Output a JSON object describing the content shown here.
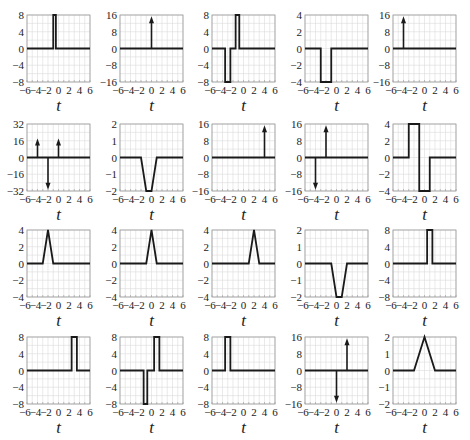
{
  "chart_data": [
    {
      "type": "line",
      "title": "",
      "xlabel": "t",
      "xlim": [
        -6,
        6
      ],
      "ylim": [
        -8,
        8
      ],
      "yticks": [
        -8,
        -4,
        0,
        4,
        8
      ],
      "xticks": [
        -6,
        -4,
        -2,
        0,
        2,
        4,
        6
      ],
      "grid": true,
      "points": [
        [
          -6,
          0
        ],
        [
          -1,
          0
        ],
        [
          -1,
          8
        ],
        [
          -0.5,
          8
        ],
        [
          -0.5,
          0
        ],
        [
          6,
          0
        ]
      ],
      "impulses": []
    },
    {
      "type": "line",
      "title": "",
      "xlabel": "t",
      "xlim": [
        -6,
        6
      ],
      "ylim": [
        -16,
        16
      ],
      "yticks": [
        -16,
        -8,
        0,
        8,
        16
      ],
      "xticks": [
        -6,
        -4,
        -2,
        0,
        2,
        4,
        6
      ],
      "grid": true,
      "points": [
        [
          -6,
          0
        ],
        [
          6,
          0
        ]
      ],
      "impulses": [
        {
          "t": 0,
          "area": 16
        }
      ]
    },
    {
      "type": "line",
      "title": "",
      "xlabel": "t",
      "xlim": [
        -6,
        6
      ],
      "ylim": [
        -8,
        8
      ],
      "yticks": [
        -8,
        -4,
        0,
        4,
        8
      ],
      "xticks": [
        -6,
        -4,
        -2,
        0,
        2,
        4,
        6
      ],
      "grid": true,
      "points": [
        [
          -6,
          0
        ],
        [
          -3.5,
          0
        ],
        [
          -3.5,
          -8
        ],
        [
          -2.5,
          -8
        ],
        [
          -2.5,
          0
        ],
        [
          -1.5,
          0
        ],
        [
          -1.5,
          8
        ],
        [
          -0.8,
          8
        ],
        [
          -0.8,
          0
        ],
        [
          6,
          0
        ]
      ],
      "impulses": []
    },
    {
      "type": "line",
      "title": "",
      "xlabel": "t",
      "xlim": [
        -6,
        6
      ],
      "ylim": [
        -4,
        4
      ],
      "yticks": [
        -4,
        -2,
        0,
        2,
        4
      ],
      "xticks": [
        -6,
        -4,
        -2,
        0,
        2,
        4,
        6
      ],
      "grid": true,
      "points": [
        [
          -6,
          0
        ],
        [
          -3,
          0
        ],
        [
          -3,
          -4
        ],
        [
          -1,
          -4
        ],
        [
          -1,
          0
        ],
        [
          6,
          0
        ]
      ],
      "impulses": []
    },
    {
      "type": "line",
      "title": "",
      "xlabel": "t",
      "xlim": [
        -6,
        6
      ],
      "ylim": [
        -16,
        16
      ],
      "yticks": [
        -16,
        -8,
        0,
        8,
        16
      ],
      "xticks": [
        -6,
        -4,
        -2,
        0,
        2,
        4,
        6
      ],
      "grid": true,
      "points": [
        [
          -6,
          0
        ],
        [
          6,
          0
        ]
      ],
      "impulses": [
        {
          "t": -4,
          "area": 16
        }
      ]
    },
    {
      "type": "line",
      "title": "",
      "xlabel": "t",
      "xlim": [
        -6,
        6
      ],
      "ylim": [
        -32,
        32
      ],
      "yticks": [
        -32,
        -16,
        0,
        16,
        32
      ],
      "xticks": [
        -6,
        -4,
        -2,
        0,
        2,
        4,
        6
      ],
      "grid": true,
      "points": [
        [
          -6,
          0
        ],
        [
          6,
          0
        ]
      ],
      "impulses": [
        {
          "t": -4,
          "area": 16
        },
        {
          "t": -2,
          "area": -32
        },
        {
          "t": 0,
          "area": 16
        }
      ]
    },
    {
      "type": "line",
      "title": "",
      "xlabel": "t",
      "xlim": [
        -6,
        6
      ],
      "ylim": [
        -2,
        2
      ],
      "yticks": [
        -2,
        -1,
        0,
        1,
        2
      ],
      "xticks": [
        -6,
        -4,
        -2,
        0,
        2,
        4,
        6
      ],
      "grid": true,
      "points": [
        [
          -6,
          0
        ],
        [
          -2,
          0
        ],
        [
          -1,
          -2
        ],
        [
          0,
          -2
        ],
        [
          1,
          0
        ],
        [
          6,
          0
        ]
      ],
      "impulses": []
    },
    {
      "type": "line",
      "title": "",
      "xlabel": "t",
      "xlim": [
        -6,
        6
      ],
      "ylim": [
        -16,
        16
      ],
      "yticks": [
        -16,
        -8,
        0,
        8,
        16
      ],
      "xticks": [
        -6,
        -4,
        -2,
        0,
        2,
        4,
        6
      ],
      "grid": true,
      "points": [
        [
          -6,
          0
        ],
        [
          6,
          0
        ]
      ],
      "impulses": [
        {
          "t": 4,
          "area": 16
        }
      ]
    },
    {
      "type": "line",
      "title": "",
      "xlabel": "t",
      "xlim": [
        -6,
        6
      ],
      "ylim": [
        -16,
        16
      ],
      "yticks": [
        -16,
        -8,
        0,
        8,
        16
      ],
      "xticks": [
        -6,
        -4,
        -2,
        0,
        2,
        4,
        6
      ],
      "grid": true,
      "points": [
        [
          -6,
          0
        ],
        [
          6,
          0
        ]
      ],
      "impulses": [
        {
          "t": -4,
          "area": -16
        },
        {
          "t": -2,
          "area": 16
        }
      ]
    },
    {
      "type": "line",
      "title": "",
      "xlabel": "t",
      "xlim": [
        -6,
        6
      ],
      "ylim": [
        -4,
        4
      ],
      "yticks": [
        -4,
        -2,
        0,
        2,
        4
      ],
      "xticks": [
        -6,
        -4,
        -2,
        0,
        2,
        4,
        6
      ],
      "grid": true,
      "points": [
        [
          -6,
          0
        ],
        [
          -3,
          0
        ],
        [
          -3,
          4
        ],
        [
          -1,
          4
        ],
        [
          -1,
          -4
        ],
        [
          1,
          -4
        ],
        [
          1,
          0
        ],
        [
          6,
          0
        ]
      ],
      "impulses": []
    },
    {
      "type": "line",
      "title": "",
      "xlabel": "t",
      "xlim": [
        -6,
        6
      ],
      "ylim": [
        -4,
        4
      ],
      "yticks": [
        -4,
        -2,
        0,
        2,
        4
      ],
      "xticks": [
        -6,
        -4,
        -2,
        0,
        2,
        4,
        6
      ],
      "grid": true,
      "points": [
        [
          -6,
          0
        ],
        [
          -3,
          0
        ],
        [
          -2,
          4
        ],
        [
          -1,
          0
        ],
        [
          6,
          0
        ]
      ],
      "impulses": []
    },
    {
      "type": "line",
      "title": "",
      "xlabel": "t",
      "xlim": [
        -6,
        6
      ],
      "ylim": [
        -4,
        4
      ],
      "yticks": [
        -4,
        -2,
        0,
        2,
        4
      ],
      "xticks": [
        -6,
        -4,
        -2,
        0,
        2,
        4,
        6
      ],
      "grid": true,
      "points": [
        [
          -6,
          0
        ],
        [
          -1,
          0
        ],
        [
          0,
          4
        ],
        [
          1,
          0
        ],
        [
          6,
          0
        ]
      ],
      "impulses": []
    },
    {
      "type": "line",
      "title": "",
      "xlabel": "t",
      "xlim": [
        -6,
        6
      ],
      "ylim": [
        -4,
        4
      ],
      "yticks": [
        -4,
        -2,
        0,
        2,
        4
      ],
      "xticks": [
        -6,
        -4,
        -2,
        0,
        2,
        4,
        6
      ],
      "grid": true,
      "points": [
        [
          -6,
          0
        ],
        [
          1,
          0
        ],
        [
          2,
          4
        ],
        [
          3,
          0
        ],
        [
          6,
          0
        ]
      ],
      "impulses": []
    },
    {
      "type": "line",
      "title": "",
      "xlabel": "t",
      "xlim": [
        -6,
        6
      ],
      "ylim": [
        -2,
        2
      ],
      "yticks": [
        -2,
        -1,
        0,
        1,
        2
      ],
      "xticks": [
        -6,
        -4,
        -2,
        0,
        2,
        4,
        6
      ],
      "grid": true,
      "points": [
        [
          -6,
          0
        ],
        [
          -1,
          0
        ],
        [
          0,
          -2
        ],
        [
          1,
          -2
        ],
        [
          2,
          0
        ],
        [
          6,
          0
        ]
      ],
      "impulses": []
    },
    {
      "type": "line",
      "title": "",
      "xlabel": "t",
      "xlim": [
        -6,
        6
      ],
      "ylim": [
        -8,
        8
      ],
      "yticks": [
        -8,
        -4,
        0,
        4,
        8
      ],
      "xticks": [
        -6,
        -4,
        -2,
        0,
        2,
        4,
        6
      ],
      "grid": true,
      "points": [
        [
          -6,
          0
        ],
        [
          0.5,
          0
        ],
        [
          0.5,
          8
        ],
        [
          1.5,
          8
        ],
        [
          1.5,
          0
        ],
        [
          6,
          0
        ]
      ],
      "impulses": []
    },
    {
      "type": "line",
      "title": "",
      "xlabel": "t",
      "xlim": [
        -6,
        6
      ],
      "ylim": [
        -8,
        8
      ],
      "yticks": [
        -8,
        -4,
        0,
        4,
        8
      ],
      "xticks": [
        -6,
        -4,
        -2,
        0,
        2,
        4,
        6
      ],
      "grid": true,
      "points": [
        [
          -6,
          0
        ],
        [
          2.5,
          0
        ],
        [
          2.5,
          8
        ],
        [
          3.5,
          8
        ],
        [
          3.5,
          0
        ],
        [
          6,
          0
        ]
      ],
      "impulses": []
    },
    {
      "type": "line",
      "title": "",
      "xlabel": "t",
      "xlim": [
        -6,
        6
      ],
      "ylim": [
        -8,
        8
      ],
      "yticks": [
        -8,
        -4,
        0,
        4,
        8
      ],
      "xticks": [
        -6,
        -4,
        -2,
        0,
        2,
        4,
        6
      ],
      "grid": true,
      "points": [
        [
          -6,
          0
        ],
        [
          -1.5,
          0
        ],
        [
          -1.5,
          -8
        ],
        [
          -0.8,
          -8
        ],
        [
          -0.8,
          0
        ],
        [
          0.5,
          0
        ],
        [
          0.5,
          8
        ],
        [
          1.5,
          8
        ],
        [
          1.5,
          0
        ],
        [
          6,
          0
        ]
      ],
      "impulses": []
    },
    {
      "type": "line",
      "title": "",
      "xlabel": "t",
      "xlim": [
        -6,
        6
      ],
      "ylim": [
        -8,
        8
      ],
      "yticks": [
        -8,
        -4,
        0,
        4,
        8
      ],
      "xticks": [
        -6,
        -4,
        -2,
        0,
        2,
        4,
        6
      ],
      "grid": true,
      "points": [
        [
          -6,
          0
        ],
        [
          -3.5,
          0
        ],
        [
          -3.5,
          8
        ],
        [
          -2.5,
          8
        ],
        [
          -2.5,
          0
        ],
        [
          6,
          0
        ]
      ],
      "impulses": []
    },
    {
      "type": "line",
      "title": "",
      "xlabel": "t",
      "xlim": [
        -6,
        6
      ],
      "ylim": [
        -16,
        16
      ],
      "yticks": [
        -16,
        -8,
        0,
        8,
        16
      ],
      "xticks": [
        -6,
        -4,
        -2,
        0,
        2,
        4,
        6
      ],
      "grid": true,
      "points": [
        [
          -6,
          0
        ],
        [
          6,
          0
        ]
      ],
      "impulses": [
        {
          "t": 0,
          "area": -16
        },
        {
          "t": 2,
          "area": 16
        }
      ]
    },
    {
      "type": "line",
      "title": "",
      "xlabel": "t",
      "xlim": [
        -6,
        6
      ],
      "ylim": [
        -2,
        2
      ],
      "yticks": [
        -2,
        -1,
        0,
        1,
        2
      ],
      "xticks": [
        -6,
        -4,
        -2,
        0,
        2,
        4,
        6
      ],
      "grid": true,
      "points": [
        [
          -6,
          0
        ],
        [
          -2,
          0
        ],
        [
          0,
          2
        ],
        [
          2,
          0
        ],
        [
          6,
          0
        ]
      ],
      "impulses": []
    }
  ],
  "layout": {
    "col_lefts": [
      27,
      120,
      212,
      305,
      393
    ],
    "row_tops": [
      15,
      124,
      230,
      337
    ],
    "box_w": 63,
    "box_h": 67
  },
  "colors": {
    "line": "#1a1a1a",
    "grid": "#dcdcdc",
    "frame": "#9a9a9a",
    "text": "#222222"
  }
}
